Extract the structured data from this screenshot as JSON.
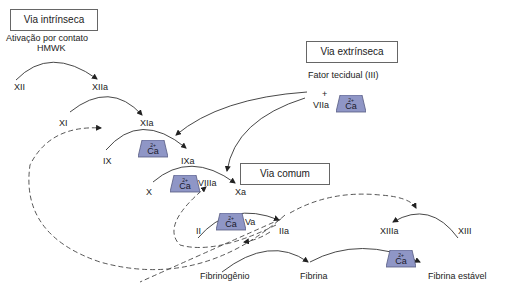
{
  "title_boxes": {
    "intrinsic": "Via intrínseca",
    "extrinsic": "Via extrínseca",
    "common": "Via comum"
  },
  "notes": {
    "contact_activation_line1": "Ativação por contato",
    "contact_activation_line2": "HMWK",
    "tissue_factor": "Fator tecidual (III)",
    "plus": "+"
  },
  "factors": {
    "XII": "XII",
    "XIIa": "XIIa",
    "XI": "XI",
    "XIa": "XIa",
    "IX": "IX",
    "IXa": "IXa",
    "VIIa": "VIIa",
    "X": "X",
    "VIIIa": "VIIIa",
    "Xa": "Xa",
    "II": "II",
    "Va": "Va",
    "IIa": "IIa",
    "XIIIa": "XIIIa",
    "XIII": "XIII",
    "fibrinogen": "Fibrinogênio",
    "fibrin": "Fibrina",
    "stable_fibrin": "Fibrina estável"
  },
  "calcium": {
    "symbol": "Ca",
    "charge": "2+",
    "color": "#8f96c6"
  },
  "colors": {
    "line": "#333333",
    "box_border": "#666666"
  }
}
